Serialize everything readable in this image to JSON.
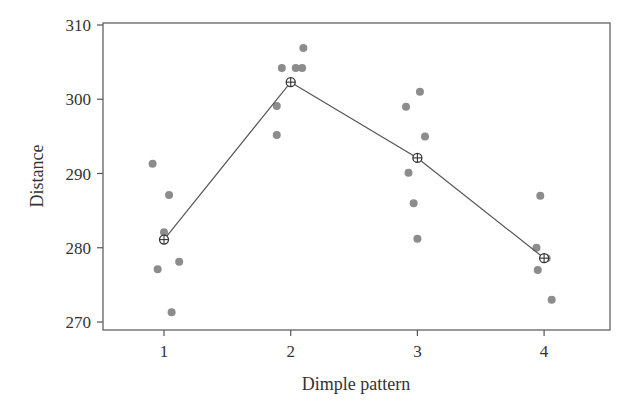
{
  "chart_data": {
    "type": "scatter",
    "title": "",
    "xlabel": "Dimple pattern",
    "ylabel": "Distance",
    "x_ticks": [
      "1",
      "2",
      "3",
      "4"
    ],
    "y_ticks": [
      "270",
      "280",
      "290",
      "300",
      "310"
    ],
    "xlim": [
      0.52,
      4.53
    ],
    "ylim": [
      269,
      310.3
    ],
    "grid": false,
    "legend": null,
    "series": [
      {
        "name": "observations",
        "kind": "scatter",
        "color": "#8c8c8c",
        "points": [
          {
            "x": 0.91,
            "y": 291.3
          },
          {
            "x": 1.04,
            "y": 287.1
          },
          {
            "x": 1.0,
            "y": 282.1
          },
          {
            "x": 1.12,
            "y": 278.1
          },
          {
            "x": 0.95,
            "y": 277.1
          },
          {
            "x": 1.06,
            "y": 271.3
          },
          {
            "x": 2.1,
            "y": 306.9
          },
          {
            "x": 1.93,
            "y": 304.2
          },
          {
            "x": 2.04,
            "y": 304.2
          },
          {
            "x": 2.09,
            "y": 304.2
          },
          {
            "x": 1.89,
            "y": 299.1
          },
          {
            "x": 1.89,
            "y": 295.2
          },
          {
            "x": 2.91,
            "y": 299.0
          },
          {
            "x": 3.02,
            "y": 301.0
          },
          {
            "x": 3.06,
            "y": 295.0
          },
          {
            "x": 2.93,
            "y": 290.1
          },
          {
            "x": 2.97,
            "y": 286.0
          },
          {
            "x": 3.0,
            "y": 281.2
          },
          {
            "x": 3.97,
            "y": 287.0
          },
          {
            "x": 3.94,
            "y": 280.0
          },
          {
            "x": 4.02,
            "y": 278.6
          },
          {
            "x": 3.95,
            "y": 277.0
          },
          {
            "x": 4.06,
            "y": 273.0
          }
        ]
      },
      {
        "name": "group means",
        "kind": "line",
        "color": "#333333",
        "marker": "circle-plus",
        "x": [
          1,
          2,
          3,
          4
        ],
        "values": [
          281.1,
          302.3,
          292.1,
          278.6
        ]
      }
    ]
  }
}
